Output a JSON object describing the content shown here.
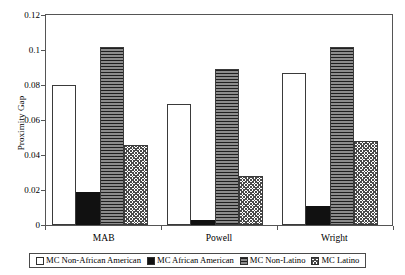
{
  "chart_data": {
    "type": "bar",
    "title": "",
    "xlabel": "",
    "ylabel": "Proximity Gap",
    "categories": [
      "MAB",
      "Powell",
      "Wright"
    ],
    "ylim": [
      0,
      0.12
    ],
    "yticks": [
      "0",
      "0.02",
      "0.04",
      "0.06",
      "0.08",
      "0.1",
      "0.12"
    ],
    "ytick_values": [
      0,
      0.02,
      0.04,
      0.06,
      0.08,
      0.1,
      0.12
    ],
    "grid": false,
    "legend_position": "bottom",
    "series": [
      {
        "name": "MC Non-African American",
        "pattern": "white-open",
        "values": [
          0.08,
          0.069,
          0.087
        ]
      },
      {
        "name": "MC African American",
        "pattern": "solid-black",
        "values": [
          0.019,
          0.003,
          0.011
        ]
      },
      {
        "name": "MC Non-Latino",
        "pattern": "horizontal-lines-dark",
        "values": [
          0.102,
          0.089,
          0.102
        ]
      },
      {
        "name": "MC Latino",
        "pattern": "cross-hatch",
        "values": [
          0.046,
          0.028,
          0.048
        ]
      }
    ]
  }
}
